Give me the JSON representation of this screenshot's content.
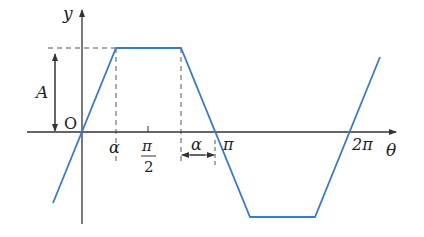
{
  "diagram": {
    "axes": {
      "x_label": "θ",
      "y_label": "y",
      "origin_label": "O"
    },
    "amplitude_label": "A",
    "x_ticks": [
      {
        "id": "alpha",
        "label": "α"
      },
      {
        "id": "half-pi",
        "numerator": "π",
        "denominator": "2"
      },
      {
        "id": "pi",
        "label": "π"
      },
      {
        "id": "two-pi",
        "label": "2π"
      }
    ],
    "gap_label": "α",
    "colors": {
      "curve": "#3a7cc2",
      "axis": "#333333",
      "dash": "#555555"
    }
  }
}
